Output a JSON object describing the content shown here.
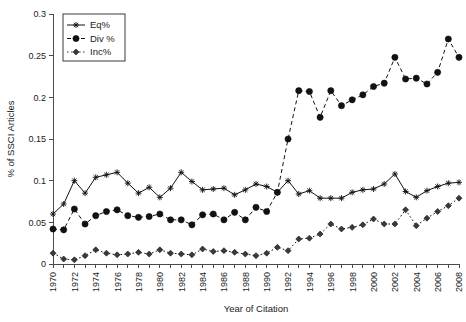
{
  "chart_data": {
    "type": "line",
    "title": "",
    "xlabel": "Year of Citation",
    "ylabel": "% of SSCI Articles",
    "xlim": [
      1970,
      2008
    ],
    "ylim": [
      0,
      0.3
    ],
    "ytick_labels": [
      "0",
      "0.05",
      "0.1",
      "0.15",
      "0.2",
      "0.25",
      "0.3"
    ],
    "ytick_values": [
      0,
      0.05,
      0.1,
      0.15,
      0.2,
      0.25,
      0.3
    ],
    "xtick_labels": [
      "1970",
      "1972",
      "1974",
      "1976",
      "1978",
      "1980",
      "1982",
      "1984",
      "1986",
      "1988",
      "1990",
      "1992",
      "1994",
      "1996",
      "1998",
      "2000",
      "2002",
      "2004",
      "2006",
      "2008"
    ],
    "grid": false,
    "legend_position": "top-left",
    "x": [
      1970,
      1971,
      1972,
      1973,
      1974,
      1975,
      1976,
      1977,
      1978,
      1979,
      1980,
      1981,
      1982,
      1983,
      1984,
      1985,
      1986,
      1987,
      1988,
      1989,
      1990,
      1991,
      1992,
      1993,
      1994,
      1995,
      1996,
      1997,
      1998,
      1999,
      2000,
      2001,
      2002,
      2003,
      2004,
      2005,
      2006,
      2007,
      2008
    ],
    "series": [
      {
        "name": "Eq%",
        "marker": "star",
        "linestyle": "solid",
        "color": "#111111",
        "values": [
          0.06,
          0.072,
          0.1,
          0.085,
          0.104,
          0.107,
          0.11,
          0.097,
          0.085,
          0.092,
          0.08,
          0.091,
          0.11,
          0.099,
          0.089,
          0.09,
          0.091,
          0.083,
          0.089,
          0.096,
          0.093,
          0.086,
          0.1,
          0.084,
          0.088,
          0.079,
          0.079,
          0.079,
          0.086,
          0.089,
          0.09,
          0.096,
          0.108,
          0.087,
          0.08,
          0.088,
          0.093,
          0.097,
          0.098
        ]
      },
      {
        "name": "Div %",
        "marker": "circle",
        "linestyle": "dashed",
        "color": "#111111",
        "values": [
          0.042,
          0.041,
          0.066,
          0.048,
          0.058,
          0.063,
          0.065,
          0.058,
          0.056,
          0.057,
          0.06,
          0.053,
          0.053,
          0.047,
          0.059,
          0.06,
          0.053,
          0.062,
          0.053,
          0.068,
          0.063,
          0.086,
          0.15,
          0.208,
          0.207,
          0.176,
          0.208,
          0.19,
          0.197,
          0.203,
          0.213,
          0.217,
          0.248,
          0.222,
          0.223,
          0.216,
          0.23,
          0.27,
          0.248
        ]
      },
      {
        "name": "Inc%",
        "marker": "diamond",
        "linestyle": "dotted",
        "color": "#3a3a3a",
        "values": [
          0.013,
          0.006,
          0.005,
          0.01,
          0.017,
          0.013,
          0.011,
          0.012,
          0.014,
          0.012,
          0.017,
          0.013,
          0.012,
          0.011,
          0.018,
          0.015,
          0.016,
          0.014,
          0.012,
          0.01,
          0.013,
          0.02,
          0.016,
          0.03,
          0.031,
          0.036,
          0.048,
          0.042,
          0.044,
          0.047,
          0.054,
          0.048,
          0.048,
          0.065,
          0.046,
          0.055,
          0.063,
          0.07,
          0.079
        ]
      }
    ]
  },
  "legend": {
    "items": [
      {
        "label": "Eq%"
      },
      {
        "label": "Div %"
      },
      {
        "label": "Inc%"
      }
    ]
  }
}
